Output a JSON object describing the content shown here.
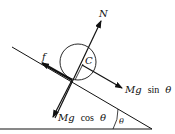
{
  "diagram": {
    "colors": {
      "line": "#111111",
      "background": "#ffffff"
    },
    "labels": {
      "normal": "N",
      "center": "C",
      "friction": "f",
      "parallel_force_prefix": "Mg",
      "parallel_force_fn": "sin",
      "parallel_force_angle": "θ",
      "perpendicular_force_prefix": "Mg",
      "perpendicular_force_fn": "cos",
      "perpendicular_force_angle": "θ",
      "incline_angle": "θ"
    },
    "forces": [
      {
        "name": "N",
        "direction": "perpendicular to incline, outward"
      },
      {
        "name": "f",
        "direction": "up the incline"
      },
      {
        "name": "Mg sin θ",
        "direction": "down the incline"
      },
      {
        "name": "Mg cos θ",
        "direction": "perpendicular into incline"
      }
    ]
  }
}
